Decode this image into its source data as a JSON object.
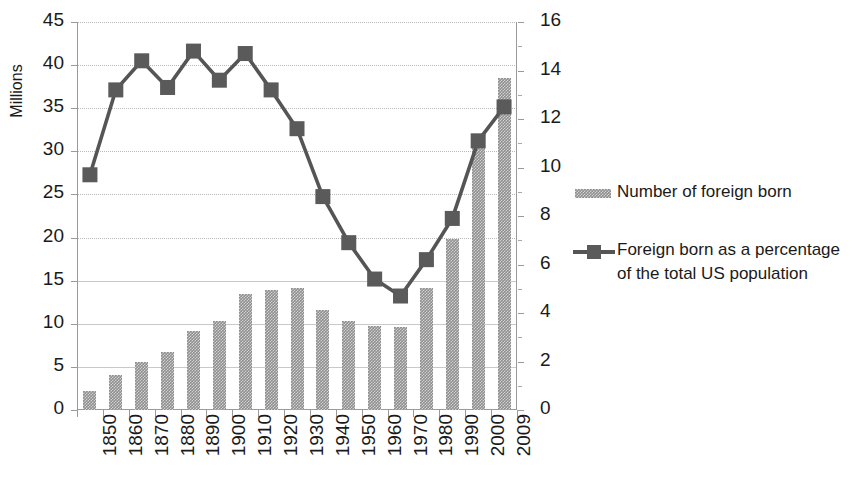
{
  "chart_data": {
    "type": "bar",
    "title": "",
    "xlabel": "",
    "ylabel": "Millions",
    "y2label": "",
    "ylim": [
      0,
      45
    ],
    "y2lim": [
      0,
      16
    ],
    "grid": true,
    "legend_position": "right",
    "categories": [
      "1850",
      "1860",
      "1870",
      "1880",
      "1890",
      "1900",
      "1910",
      "1920",
      "1930",
      "1940",
      "1950",
      "1960",
      "1970",
      "1980",
      "1990",
      "2000",
      "2009"
    ],
    "yticks": [
      "0",
      "5",
      "10",
      "15",
      "20",
      "25",
      "30",
      "35",
      "40",
      "45"
    ],
    "y2ticks": [
      "0",
      "2",
      "4",
      "6",
      "8",
      "10",
      "12",
      "14",
      "16"
    ],
    "series": [
      {
        "name": "Number of foreign born",
        "type": "bar",
        "axis": "left",
        "unit": "millions",
        "color": "#8e8e8e",
        "values": [
          2.2,
          4.1,
          5.6,
          6.7,
          9.2,
          10.3,
          13.5,
          13.9,
          14.2,
          11.6,
          10.3,
          9.7,
          9.6,
          14.1,
          19.8,
          31.1,
          38.5
        ]
      },
      {
        "name": "Foreign born as a percentage of the total US population",
        "type": "line",
        "axis": "right",
        "unit": "percent",
        "color": "#555555",
        "marker": "square",
        "values": [
          9.7,
          13.2,
          14.4,
          13.3,
          14.8,
          13.6,
          14.7,
          13.2,
          11.6,
          8.8,
          6.9,
          5.4,
          4.7,
          6.2,
          7.9,
          11.1,
          12.5
        ]
      }
    ]
  },
  "legend": {
    "entries": [
      {
        "label": "Number of foreign born",
        "key": "bar-swatch"
      },
      {
        "label": "Foreign born as a percentage of the total US population",
        "key": "line-marker"
      }
    ]
  },
  "axes": {
    "y_title": "Millions"
  }
}
